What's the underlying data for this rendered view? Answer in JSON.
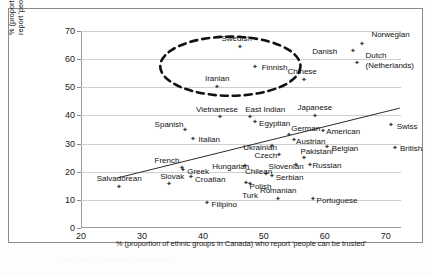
{
  "chart_data": {
    "type": "scatter",
    "title": "",
    "xlabel": "% (proportion of ethnic groups in Canada) who report 'people can be trusted'",
    "ylabel": "% (proportion of ethnic groups' countries of origin) who report 'people can be trusted'",
    "xlim": [
      20,
      72.5
    ],
    "ylim": [
      0,
      70
    ],
    "xticks": [
      20,
      30,
      40,
      50,
      60,
      70
    ],
    "yticks": [
      0,
      10,
      20,
      30,
      40,
      50,
      60,
      70
    ],
    "grid": "horizontal",
    "legend": "none",
    "trendline": {
      "x1": 26.0,
      "y1": 17.8,
      "x2": 72.3,
      "y2": 42.6,
      "style": "solid"
    },
    "annotations": [
      {
        "name": "highlight-ellipse",
        "shape": "dashed-ellipse",
        "cx": 44.5,
        "cy": 57.5,
        "rx": 11.5,
        "ry": 10.5
      }
    ],
    "points": [
      {
        "label": "Norwegian",
        "x": 66.0,
        "y": 65.0,
        "lx": 10,
        "ly": -14
      },
      {
        "label": "Danish",
        "x": 64.5,
        "y": 62.5,
        "lx": -40,
        "ly": -4
      },
      {
        "label": "Dutch",
        "x": 65.2,
        "y": 58.0,
        "lx": 9,
        "ly": -13
      },
      {
        "label": "(Netherlands)",
        "x": 65.2,
        "y": 58.0,
        "lx": 9,
        "ly": -3
      },
      {
        "label": "Swedish",
        "x": 46.0,
        "y": 63.8,
        "lx": -18,
        "ly": -13
      },
      {
        "label": "Finnish",
        "x": 48.5,
        "y": 56.8,
        "lx": 7,
        "ly": -4
      },
      {
        "label": "Iranian",
        "x": 42.3,
        "y": 49.7,
        "lx": -12,
        "ly": -13
      },
      {
        "label": "Chinese",
        "x": 56.5,
        "y": 52.2,
        "lx": -16,
        "ly": -13
      },
      {
        "label": "Vietnamese",
        "x": 42.8,
        "y": 38.8,
        "lx": -24,
        "ly": -13
      },
      {
        "label": "East Indian",
        "x": 47.6,
        "y": 38.8,
        "lx": -4,
        "ly": -13
      },
      {
        "label": "Egyptian",
        "x": 48.4,
        "y": 37.3,
        "lx": 5,
        "ly": -3
      },
      {
        "label": "Japanese",
        "x": 58.3,
        "y": 39.3,
        "lx": -17,
        "ly": -13
      },
      {
        "label": "Swiss",
        "x": 70.8,
        "y": 36.0,
        "lx": 6,
        "ly": -4
      },
      {
        "label": "Spanish",
        "x": 37.0,
        "y": 34.3,
        "lx": -30,
        "ly": -10
      },
      {
        "label": "Italian",
        "x": 38.3,
        "y": 31.2,
        "lx": 6,
        "ly": -4
      },
      {
        "label": "American",
        "x": 59.6,
        "y": 34.0,
        "lx": 4,
        "ly": -4
      },
      {
        "label": "German",
        "x": 54.0,
        "y": 32.5,
        "lx": 3,
        "ly": -12
      },
      {
        "label": "Austrian",
        "x": 54.8,
        "y": 30.6,
        "lx": 3,
        "ly": -4
      },
      {
        "label": "Ukrainian",
        "x": 51.2,
        "y": 28.5,
        "lx": -28,
        "ly": -4
      },
      {
        "label": "Belgian",
        "x": 60.3,
        "y": 28.2,
        "lx": 5,
        "ly": -4
      },
      {
        "label": "British",
        "x": 71.5,
        "y": 28.0,
        "lx": 5,
        "ly": -4
      },
      {
        "label": "Czech",
        "x": 52.4,
        "y": 25.5,
        "lx": -24,
        "ly": -4
      },
      {
        "label": "Pakistani",
        "x": 56.5,
        "y": 24.2,
        "lx": -3,
        "ly": -12
      },
      {
        "label": "Slovenian",
        "x": 55.2,
        "y": 21.7,
        "lx": -27,
        "ly": -4
      },
      {
        "label": "Russian",
        "x": 57.5,
        "y": 22.0,
        "lx": 3,
        "ly": -4
      },
      {
        "label": "Hungarian",
        "x": 46.8,
        "y": 21.5,
        "lx": -32,
        "ly": -4
      },
      {
        "label": "Chilean",
        "x": 50.2,
        "y": 18.7,
        "lx": -20,
        "ly": -7
      },
      {
        "label": "Serbian",
        "x": 51.3,
        "y": 18.0,
        "lx": 4,
        "ly": -3
      },
      {
        "label": "French",
        "x": 36.5,
        "y": 20.8,
        "lx": -27,
        "ly": -12
      },
      {
        "label": "Greek",
        "x": 36.6,
        "y": 20.2,
        "lx": 5,
        "ly": -3
      },
      {
        "label": "Croatian",
        "x": 37.9,
        "y": 17.6,
        "lx": 5,
        "ly": -2
      },
      {
        "label": "Polish",
        "x": 47.0,
        "y": 15.3,
        "lx": 4,
        "ly": -2
      },
      {
        "label": "Turk",
        "x": 47.6,
        "y": 15.0,
        "lx": -7,
        "ly": 6
      },
      {
        "label": "Slovak",
        "x": 34.3,
        "y": 15.0,
        "lx": -8,
        "ly": -13
      },
      {
        "label": "Salvadorean",
        "x": 26.2,
        "y": 14.1,
        "lx": -22,
        "ly": -13
      },
      {
        "label": "Filipino",
        "x": 40.6,
        "y": 8.4,
        "lx": 5,
        "ly": -3
      },
      {
        "label": "Romanian",
        "x": 52.3,
        "y": 9.7,
        "lx": -18,
        "ly": -14
      },
      {
        "label": "Portuguese",
        "x": 58.0,
        "y": 9.9,
        "lx": 4,
        "ly": -3
      }
    ]
  },
  "footer": {
    "smudge_text": "······  ··· ····  ··········   ············"
  }
}
